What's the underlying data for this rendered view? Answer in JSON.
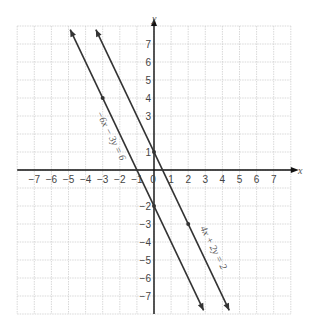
{
  "chart_data": {
    "type": "line",
    "title": "",
    "xlabel": "x",
    "ylabel": "y",
    "xlim": [
      -8,
      8
    ],
    "ylim": [
      -8,
      8
    ],
    "grid": true,
    "x_ticks": [
      "−7",
      "−6",
      "−5",
      "−4",
      "−3",
      "−2",
      "−1",
      "0",
      "1",
      "2",
      "3",
      "4",
      "5",
      "6",
      "7"
    ],
    "y_ticks": [
      "7",
      "6",
      "5",
      "4",
      "3",
      "1",
      "−2",
      "−3",
      "−4",
      "−5",
      "−6",
      "−7"
    ],
    "series": [
      {
        "name": "−6x − 3y = 6",
        "equation": "y = −2x − 2",
        "slope": -2,
        "intercept": -2,
        "marked_points": [
          [
            -3,
            4
          ],
          [
            0,
            -2
          ]
        ]
      },
      {
        "name": "4x + 2y = 2",
        "equation": "y = −2x + 1",
        "slope": -2,
        "intercept": 1,
        "marked_points": [
          [
            0,
            1
          ],
          [
            2,
            -3
          ]
        ]
      }
    ],
    "labels": {
      "line1": "−6x − 3y = 6",
      "line2": "4x + 2y = 2"
    },
    "colors": {
      "line": "#333333",
      "axis": "#111111",
      "grid": "#cfcfcf"
    }
  }
}
